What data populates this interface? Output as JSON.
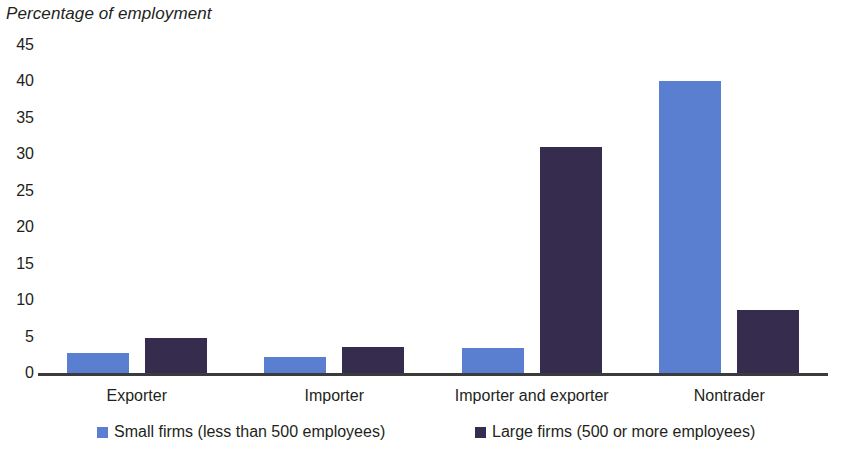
{
  "chart_data": {
    "type": "bar",
    "title": "Percentage of employment",
    "xlabel": "",
    "ylabel": "Percentage of employment",
    "ylim": [
      0,
      45
    ],
    "ytick_step": 5,
    "yticks": [
      "45",
      "40",
      "35",
      "30",
      "25",
      "20",
      "15",
      "10",
      "5",
      "0"
    ],
    "grid": false,
    "legend_position": "bottom",
    "categories": [
      "Exporter",
      "Importer",
      "Importer and exporter",
      "Nontrader"
    ],
    "series": [
      {
        "name": "Small firms (less than 500 employees)",
        "color": "#5b7fd0",
        "values": [
          2.8,
          2.2,
          3.4,
          40.0
        ]
      },
      {
        "name": "Large firms (500 or more employees)",
        "color": "#352c4e",
        "values": [
          4.8,
          3.6,
          31.0,
          8.7
        ]
      }
    ]
  },
  "legend": {
    "items": [
      {
        "label": "Small firms (less than 500 employees)",
        "color": "#5b7fd0"
      },
      {
        "label": "Large firms (500 or more employees)",
        "color": "#352c4e"
      }
    ]
  },
  "colors": {
    "small_firms": "#5b7fd0",
    "large_firms": "#352c4e",
    "axis": "#3b3b3b",
    "text": "#231f20",
    "background": "#ffffff"
  }
}
